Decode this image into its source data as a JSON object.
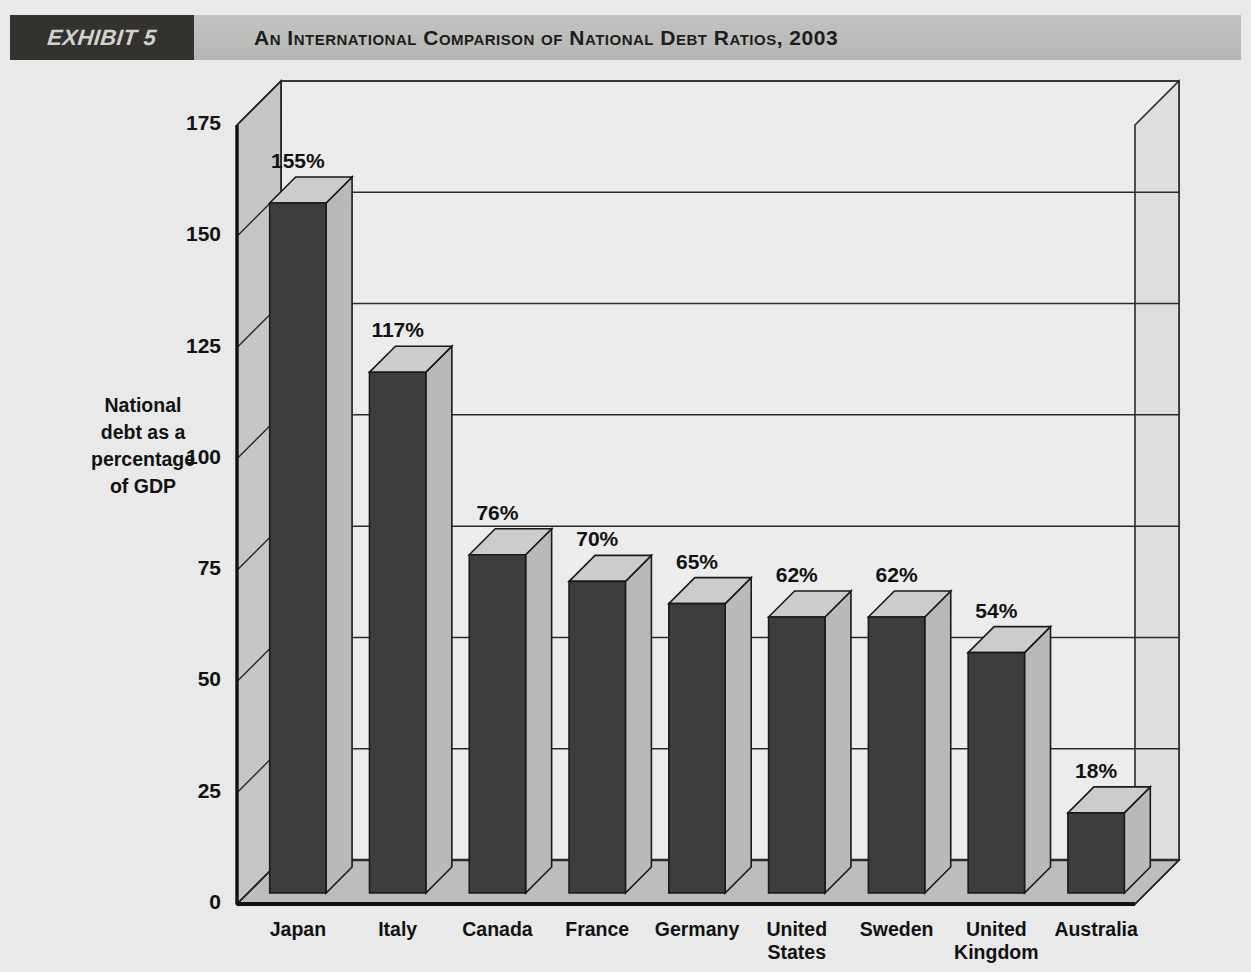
{
  "header": {
    "exhibit_label": "EXHIBIT 5",
    "title": "An International Comparison of National Debt Ratios, 2003"
  },
  "chart_data": {
    "type": "bar",
    "title": "An International Comparison of National Debt Ratios, 2003",
    "xlabel": "Country",
    "ylabel": "National debt as a percentage of GDP",
    "ylabel_lines": [
      "National",
      "debt as a",
      "percentage",
      "of  GDP"
    ],
    "categories": [
      "Japan",
      "Italy",
      "Canada",
      "France",
      "Germany",
      "United States",
      "Sweden",
      "United Kingdom",
      "Australia"
    ],
    "category_lines": [
      [
        "Japan"
      ],
      [
        "Italy"
      ],
      [
        "Canada"
      ],
      [
        "France"
      ],
      [
        "Germany"
      ],
      [
        "United",
        "States"
      ],
      [
        "Sweden"
      ],
      [
        "United",
        "Kingdom"
      ],
      [
        "Australia"
      ]
    ],
    "values": [
      155,
      117,
      76,
      70,
      65,
      62,
      62,
      54,
      18
    ],
    "data_labels": [
      "155%",
      "117%",
      "76%",
      "70%",
      "65%",
      "62%",
      "62%",
      "54%",
      "18%"
    ],
    "yticks": [
      0,
      25,
      50,
      75,
      100,
      125,
      150,
      175
    ],
    "ytick_labels": [
      "0",
      "25",
      "50",
      "75",
      "100",
      "125",
      "150",
      "175"
    ],
    "ylim": [
      0,
      175
    ],
    "grid": true,
    "legend": null,
    "style_3d": true,
    "colors": {
      "bar_front": "#3d3d3d",
      "bar_side": "#b9b9b9",
      "bar_top": "#cccccc",
      "plot_background": "#ececec",
      "wall": "#c6c6c6",
      "floor": "#bdbdbd",
      "page_background": "#e9e9e9",
      "header_tab": "#33322f",
      "header_strip": "#bcbcba",
      "text": "#121212",
      "gridline": "#2a2a2a"
    }
  }
}
